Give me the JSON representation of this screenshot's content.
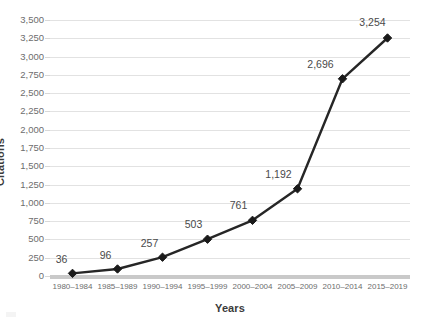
{
  "chart_data": {
    "type": "line",
    "title": "",
    "xlabel": "Years",
    "ylabel": "Citations",
    "categories": [
      "1980–1984",
      "1985–1989",
      "1990–1994",
      "1995–1999",
      "2000–2004",
      "2005–2009",
      "2010–2014",
      "2015–2019"
    ],
    "values": [
      36,
      96,
      257,
      503,
      761,
      1192,
      2696,
      3254
    ],
    "point_labels": [
      "36",
      "96",
      "257",
      "503",
      "761",
      "1,192",
      "2,696",
      "3,254"
    ],
    "ylim": [
      0,
      3500
    ],
    "ytick_step": 250,
    "ytick_labels": [
      "3,500",
      "3,250",
      "3,000",
      "2,750",
      "2,500",
      "2,250",
      "2,000",
      "1,750",
      "1,500",
      "1,250",
      "1,000",
      "750",
      "500",
      "250",
      "0"
    ],
    "ytick_values": [
      3500,
      3250,
      3000,
      2750,
      2500,
      2250,
      2000,
      1750,
      1500,
      1250,
      1000,
      750,
      500,
      250,
      0
    ],
    "grid": true,
    "legend": false,
    "legend_position": "none",
    "series_color": "#262626",
    "marker_color": "#1a1a1a",
    "marker_shape": "diamond",
    "gridline_color": "#e2e2e2",
    "axis_line_color": "#c9c9c9",
    "tick_text_color": "#6d6d6d",
    "axis_title_color": "#3b3b3b",
    "background_color": "#ffffff"
  }
}
